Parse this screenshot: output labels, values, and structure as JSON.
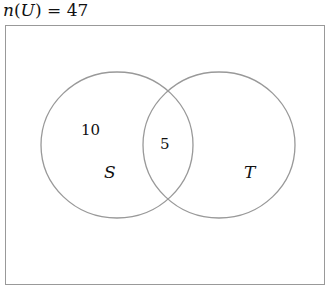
{
  "title": {
    "func": "n",
    "set": "U",
    "equals": "=",
    "value": "47"
  },
  "venn": {
    "sets": [
      {
        "name": "S",
        "only_value": "10"
      },
      {
        "name": "T",
        "only_value": ""
      }
    ],
    "intersection_value": "5",
    "stroke_color": "#999999"
  }
}
